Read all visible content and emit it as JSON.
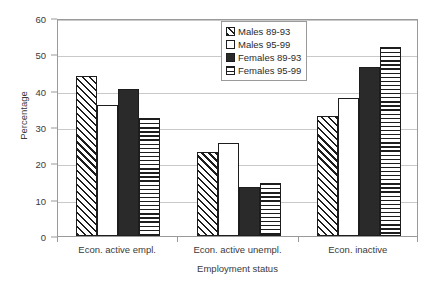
{
  "chart_data": {
    "type": "bar",
    "title": "",
    "xlabel": "Employment status",
    "ylabel": "Percentage",
    "categories": [
      "Econ. active empl.",
      "Econ. active unempl.",
      "Econ. inactive"
    ],
    "series": [
      {
        "name": "Males 89-93",
        "pattern": "diagonal-hatch",
        "values": [
          44,
          23,
          33
        ]
      },
      {
        "name": "Males 95-99",
        "pattern": "white",
        "values": [
          36,
          25.5,
          38
        ]
      },
      {
        "name": "Females 89-93",
        "pattern": "solid-black",
        "values": [
          40.5,
          13.5,
          46.5
        ]
      },
      {
        "name": "Females 95-99",
        "pattern": "horizontal-lines",
        "values": [
          32.5,
          14.5,
          52
        ]
      }
    ],
    "ylim": [
      0,
      60
    ],
    "yticks": [
      0,
      10,
      20,
      30,
      40,
      50,
      60
    ],
    "ytick_labels": [
      "0",
      "10",
      "20",
      "30",
      "40",
      "50",
      "60"
    ],
    "grid": true,
    "legend_position": "top-center",
    "colors": {
      "axis": "#9a9a9a",
      "grid": "#c9c9c9",
      "bar_outline": "#1d1d1d",
      "bar_solid": "#2a2a2a",
      "text": "#2b2b2b",
      "background": "#ffffff"
    }
  }
}
